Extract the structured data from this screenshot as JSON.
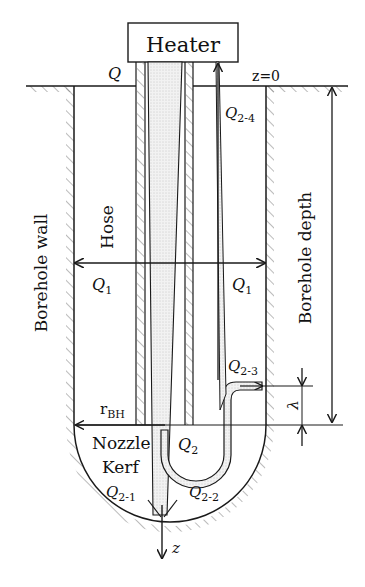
{
  "diagram": {
    "title_box": "Heater",
    "labels": {
      "q": "Q",
      "z0": "z=0",
      "q24_main": "Q",
      "q24_sub": "2-4",
      "borehole_depth": "Borehole depth",
      "borehole_wall": "Borehole wall",
      "hose": "Hose",
      "q1_left": "Q",
      "q1_left_sub": "1",
      "q1_right": "Q",
      "q1_right_sub": "1",
      "q23_main": "Q",
      "q23_sub": "2-3",
      "lambda": "λ",
      "rbh_main": "r",
      "rbh_sub": "BH",
      "nozzle": "Nozzle",
      "kerf": "Kerf",
      "q2_main": "Q",
      "q2_sub": "2",
      "q21_main": "Q",
      "q21_sub": "2-1",
      "q22_main": "Q",
      "q22_sub": "2-2",
      "z_axis": "z"
    },
    "colors": {
      "line": "#1a1a1a",
      "stipple": "#e6e6e6",
      "hatch": "#666666",
      "background": "#ffffff"
    }
  }
}
